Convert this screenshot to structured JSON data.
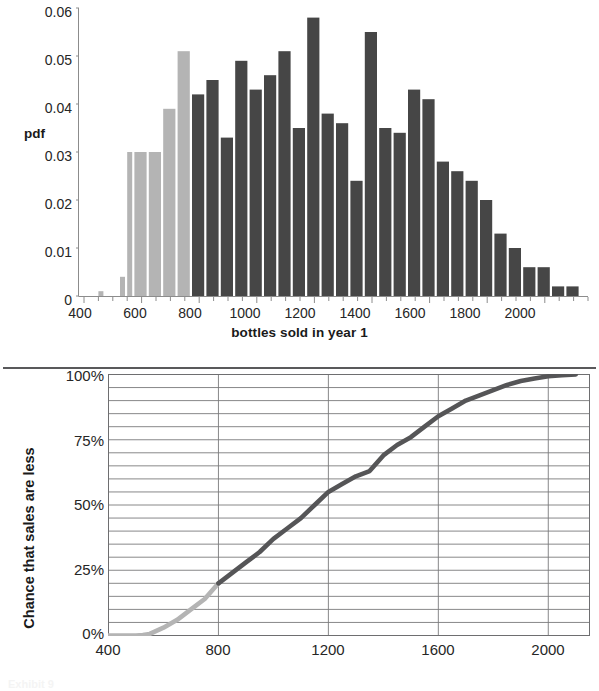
{
  "figure": {
    "caption": "Exhibit 9"
  },
  "top_chart": {
    "xlabel": "bottles sold in year 1",
    "ylabel": "pdf",
    "ytick_labels": [
      "0.06",
      "0.05",
      "0.04",
      "0.03",
      "0.02",
      "0.01",
      "0"
    ],
    "xtick_labels": [
      "400",
      "600",
      "800",
      "1000",
      "1200",
      "1400",
      "1600",
      "1800",
      "2000"
    ],
    "colors": {
      "light_bar": "#b4b4b4",
      "dark_bar": "#464646",
      "axis": "#8c8c8c",
      "text": "#262626"
    }
  },
  "bottom_chart": {
    "xlabel": "Bottles sold in year 1",
    "ylabel": "Chance that sales are less",
    "ytick_labels": [
      "100%",
      "75%",
      "50%",
      "25%",
      "0%"
    ],
    "xtick_labels": [
      "400",
      "800",
      "1200",
      "1600",
      "2000"
    ],
    "colors": {
      "light_line": "#b4b4b4",
      "dark_line": "#555557",
      "grid": "#7a7a7c",
      "frame": "#6e6e70"
    }
  },
  "chart_data": [
    {
      "type": "bar",
      "id": "pdf-histogram",
      "title": "",
      "xlabel": "bottles sold in year 1",
      "ylabel": "pdf",
      "xlim": [
        400,
        2150
      ],
      "ylim": [
        0,
        0.06
      ],
      "ytick_step": 0.01,
      "xtick_step": 200,
      "grid": false,
      "legend": "none",
      "bin_width": 50,
      "split_at": 775,
      "light_color": "#b4b4b4",
      "dark_color": "#464646",
      "note": "bins left-edge; bars left of 775 are light gray, at/after 775 dark gray",
      "bins": [
        {
          "x0": 425,
          "x1": 450,
          "value": 0.0
        },
        {
          "x0": 450,
          "x1": 475,
          "value": 0.001
        },
        {
          "x0": 475,
          "x1": 525,
          "value": 0.0
        },
        {
          "x0": 525,
          "x1": 550,
          "value": 0.004
        },
        {
          "x0": 550,
          "x1": 575,
          "value": 0.03
        },
        {
          "x0": 575,
          "x1": 625,
          "value": 0.03
        },
        {
          "x0": 625,
          "x1": 675,
          "value": 0.03
        },
        {
          "x0": 675,
          "x1": 725,
          "value": 0.039
        },
        {
          "x0": 725,
          "x1": 775,
          "value": 0.051
        },
        {
          "x0": 775,
          "x1": 825,
          "value": 0.042
        },
        {
          "x0": 825,
          "x1": 875,
          "value": 0.045
        },
        {
          "x0": 875,
          "x1": 925,
          "value": 0.033
        },
        {
          "x0": 925,
          "x1": 975,
          "value": 0.049
        },
        {
          "x0": 975,
          "x1": 1025,
          "value": 0.043
        },
        {
          "x0": 1025,
          "x1": 1075,
          "value": 0.046
        },
        {
          "x0": 1075,
          "x1": 1125,
          "value": 0.051
        },
        {
          "x0": 1125,
          "x1": 1175,
          "value": 0.035
        },
        {
          "x0": 1175,
          "x1": 1225,
          "value": 0.058
        },
        {
          "x0": 1225,
          "x1": 1275,
          "value": 0.038
        },
        {
          "x0": 1275,
          "x1": 1325,
          "value": 0.036
        },
        {
          "x0": 1325,
          "x1": 1375,
          "value": 0.024
        },
        {
          "x0": 1375,
          "x1": 1425,
          "value": 0.055
        },
        {
          "x0": 1425,
          "x1": 1475,
          "value": 0.035
        },
        {
          "x0": 1475,
          "x1": 1525,
          "value": 0.034
        },
        {
          "x0": 1525,
          "x1": 1575,
          "value": 0.043
        },
        {
          "x0": 1575,
          "x1": 1625,
          "value": 0.041
        },
        {
          "x0": 1625,
          "x1": 1675,
          "value": 0.028
        },
        {
          "x0": 1675,
          "x1": 1725,
          "value": 0.026
        },
        {
          "x0": 1725,
          "x1": 1775,
          "value": 0.024
        },
        {
          "x0": 1775,
          "x1": 1825,
          "value": 0.02
        },
        {
          "x0": 1825,
          "x1": 1875,
          "value": 0.013
        },
        {
          "x0": 1875,
          "x1": 1925,
          "value": 0.01
        },
        {
          "x0": 1925,
          "x1": 1975,
          "value": 0.006
        },
        {
          "x0": 1975,
          "x1": 2025,
          "value": 0.006
        },
        {
          "x0": 2025,
          "x1": 2075,
          "value": 0.002
        },
        {
          "x0": 2075,
          "x1": 2125,
          "value": 0.002
        }
      ]
    },
    {
      "type": "line",
      "id": "cdf-curve",
      "title": "",
      "xlabel": "Bottles sold in year 1",
      "ylabel": "Chance that sales are less",
      "xlim": [
        400,
        2150
      ],
      "ylim": [
        0,
        100
      ],
      "ytick_step": 25,
      "grid": true,
      "grid_y_minor_step": 5,
      "grid_x_step": 400,
      "legend": "none",
      "split_at": 800,
      "light_color": "#b4b4b4",
      "dark_color": "#555557",
      "x": [
        400,
        450,
        500,
        525,
        550,
        600,
        650,
        700,
        750,
        800,
        850,
        900,
        950,
        1000,
        1050,
        1100,
        1150,
        1200,
        1250,
        1300,
        1350,
        1400,
        1450,
        1500,
        1550,
        1600,
        1650,
        1700,
        1750,
        1800,
        1850,
        1900,
        1950,
        2000,
        2050,
        2100
      ],
      "y": [
        0,
        0,
        0,
        0.2,
        0.6,
        3,
        6,
        10,
        14,
        20,
        24,
        28,
        32,
        37,
        41,
        45,
        50,
        55,
        58,
        61,
        63,
        69,
        73,
        76,
        80,
        84,
        87,
        90,
        92,
        94,
        96,
        97.5,
        98.5,
        99.3,
        99.7,
        100
      ]
    }
  ]
}
